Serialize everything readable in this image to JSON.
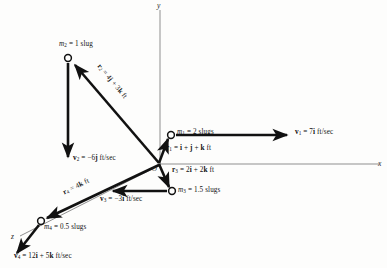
{
  "figure": {
    "background_color": "#fdfdfc",
    "ink_color": "#111111",
    "axis_color": "#8a8a8a"
  },
  "axes": {
    "origin_label": "O",
    "x_label": "x",
    "y_label": "y",
    "z_label": "z"
  },
  "particles": [
    {
      "id": "m1",
      "mass_label": "m₁ = 2 slugs",
      "mass_text_parts": {
        "symbol": "m",
        "sub": "1",
        "value": "= 2 slugs"
      },
      "position_label": "r₁ = i + j + k ft",
      "velocity_label": "v₁ = 7i ft/sec"
    },
    {
      "id": "m2",
      "mass_label": "m₂ = 1 slug",
      "mass_text_parts": {
        "symbol": "m",
        "sub": "2",
        "value": "= 1 slug"
      },
      "position_label": "r₂ = 4j + 3k ft",
      "velocity_label": "v₂ = −6j ft/sec"
    },
    {
      "id": "m3",
      "mass_label": "m₃ = 1.5 slugs",
      "mass_text_parts": {
        "symbol": "m",
        "sub": "3",
        "value": "= 1.5 slugs"
      },
      "position_label": "r₃ = 2i + 2k ft",
      "velocity_label": "v₃ = −3i ft/sec"
    },
    {
      "id": "m4",
      "mass_label": "m₄ = 0.5 slugs",
      "mass_text_parts": {
        "symbol": "m",
        "sub": "4",
        "value": "= 0.5 slugs"
      },
      "position_label": "r₄ = 4k ft",
      "velocity_label": "v₄ = 12i + 5k ft/sec"
    }
  ],
  "labels": {
    "m1_mass_sym": "m",
    "m1_mass_sub": "1",
    "m1_mass_rest": "= 2 slugs",
    "m2_mass_sym": "m",
    "m2_mass_sub": "2",
    "m2_mass_rest": "= 1 slug",
    "m3_mass_sym": "m",
    "m3_mass_sub": "3",
    "m3_mass_rest": "= 1.5 slugs",
    "m4_mass_sym": "m",
    "m4_mass_sub": "4",
    "m4_mass_rest": "= 0.5 slugs",
    "r1_sym": "r",
    "r1_sub": "1",
    "r1_rest_a": "= ",
    "r1_i": "i",
    "r1_plus1": " + ",
    "r1_j": "j",
    "r1_plus2": " + ",
    "r1_k": "k",
    "r1_unit": " ft",
    "r2_sym": "r",
    "r2_sub": "2",
    "r2_eq": "= 4",
    "r2_j": "j",
    "r2_plus": " + 3",
    "r2_k": "k",
    "r2_unit": " ft",
    "r3_sym": "r",
    "r3_sub": "3",
    "r3_eq": "= 2",
    "r3_i": "i",
    "r3_plus": " + 2",
    "r3_k": "k",
    "r3_unit": " ft",
    "r4_sym": "r",
    "r4_sub": "4",
    "r4_eq": "= 4",
    "r4_k": "k",
    "r4_unit": " ft",
    "v1_sym": "v",
    "v1_sub": "1",
    "v1_eq": "= 7",
    "v1_i": "i",
    "v1_unit": " ft/sec",
    "v2_sym": "v",
    "v2_sub": "2",
    "v2_eq": "= −6",
    "v2_j": "j",
    "v2_unit": " ft/sec",
    "v3_sym": "v",
    "v3_sub": "3",
    "v3_eq": "= −3",
    "v3_i": "i",
    "v3_unit": " ft/sec",
    "v4_sym": "v",
    "v4_sub": "4",
    "v4_eq": "= 12",
    "v4_i": "i",
    "v4_plus": " + 5",
    "v4_k": "k",
    "v4_unit": " ft/sec"
  },
  "geometry": {
    "origin": {
      "x": 160,
      "y": 164
    },
    "y_axis_top": {
      "x": 160,
      "y": 8
    },
    "x_axis_right": {
      "x": 380,
      "y": 164
    },
    "z_axis_end": {
      "x": 18,
      "y": 238
    },
    "m1_node": {
      "x": 171,
      "y": 135
    },
    "m2_node": {
      "x": 68,
      "y": 58
    },
    "m3_node": {
      "x": 172,
      "y": 191
    },
    "m4_node": {
      "x": 41,
      "y": 221
    },
    "v1_arrow_end": {
      "x": 289,
      "y": 135
    },
    "v2_arrow_end": {
      "x": 68,
      "y": 160
    },
    "v3_arrow_end": {
      "x": 110,
      "y": 191
    },
    "v4_arrow_end": {
      "x": 14,
      "y": 256
    }
  }
}
